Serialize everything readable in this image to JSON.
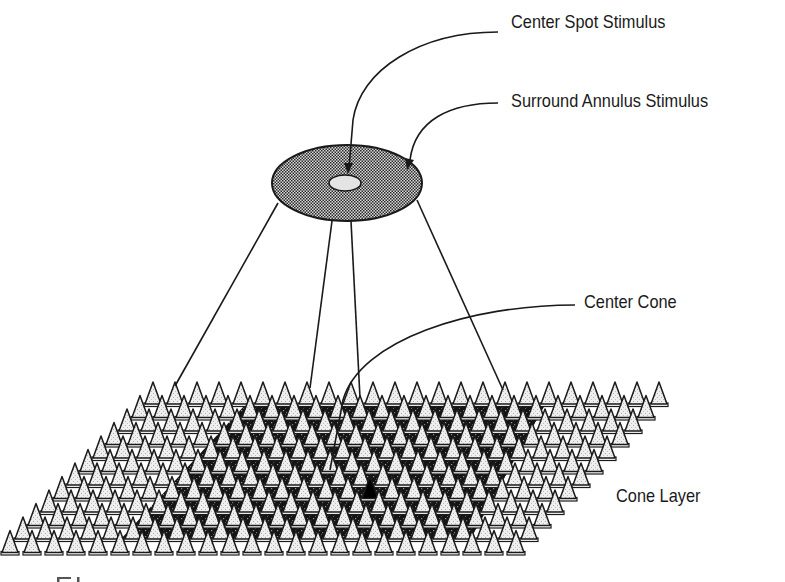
{
  "figure": {
    "labels": {
      "center_spot": "Center Spot Stimulus",
      "surround_annulus": "Surround Annulus Stimulus",
      "center_cone": "Center Cone",
      "cone_layer": "Cone Layer",
      "caption_fragment": "Fi"
    },
    "stimulus": {
      "outer_ellipse": {
        "cx": 347,
        "cy": 183,
        "rx": 75,
        "ry": 38,
        "fill": "stippled gray"
      },
      "inner_ellipse": {
        "cx": 345,
        "cy": 183,
        "rx": 16,
        "ry": 8,
        "fill": "light gray"
      }
    },
    "cone_grid": {
      "rows": 12,
      "cones_per_row": 24,
      "pitch_x": 22,
      "row_step_x": -13,
      "row_step_y": 13.5,
      "back_row_origin": [
        153,
        382
      ],
      "cone_width": 16,
      "cone_height": 22,
      "center_cone": {
        "row": 7,
        "col": 14,
        "fill": "black"
      }
    },
    "colors": {
      "ink": "#1a1a1a",
      "cone_fill": "#ececec",
      "stipple": "#9a9a9a",
      "dark_region": "#141414",
      "background": "#ffffff"
    }
  }
}
